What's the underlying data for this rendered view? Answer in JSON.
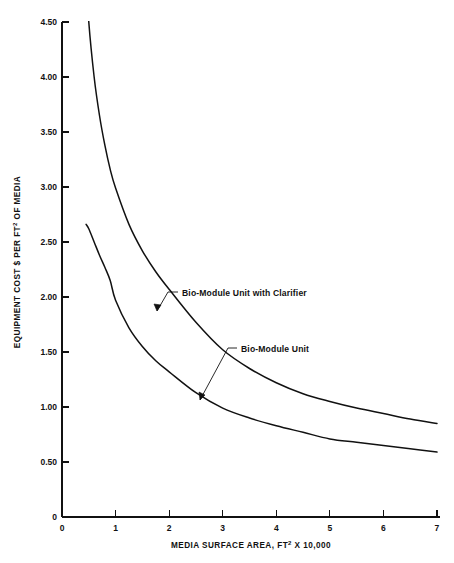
{
  "chart_data": {
    "type": "line",
    "title": "",
    "xlabel": "MEDIA SURFACE AREA, FT² X 10,000",
    "ylabel": "EQUIPMENT COST $ PER FT² OF MEDIA",
    "xlabel_parts": {
      "pre": "MEDIA SURFACE AREA, FT",
      "sup": "2",
      "post": " X 10,000"
    },
    "ylabel_parts": {
      "pre": "EQUIPMENT COST $ PER FT",
      "sup": "2",
      "post": " OF MEDIA"
    },
    "xlim": [
      0,
      7
    ],
    "ylim": [
      0,
      4.5
    ],
    "grid": false,
    "legend_position": "inline-annotations",
    "x_ticks": [
      "0",
      "1",
      "2",
      "3",
      "4",
      "5",
      "6",
      "7"
    ],
    "x_tick_values": [
      0,
      1,
      2,
      3,
      4,
      5,
      6,
      7
    ],
    "y_ticks": [
      "0",
      "0.50",
      "1.00",
      "1.50",
      "2.00",
      "2.50",
      "3.00",
      "3.50",
      "4.00",
      "4.50"
    ],
    "y_tick_values": [
      0,
      0.5,
      1.0,
      1.5,
      2.0,
      2.5,
      3.0,
      3.5,
      4.0,
      4.5
    ],
    "series": [
      {
        "name": "Bio-Module Unit with Clarifier",
        "x": [
          0.45,
          0.5,
          0.6,
          0.7,
          0.8,
          0.9,
          1.0,
          1.25,
          1.5,
          1.75,
          2.0,
          2.5,
          3.0,
          3.5,
          4.0,
          4.5,
          5.0,
          5.5,
          6.0,
          6.5,
          7.0
        ],
        "y": [
          4.95,
          4.5,
          4.0,
          3.65,
          3.38,
          3.16,
          2.99,
          2.66,
          2.42,
          2.23,
          2.07,
          1.77,
          1.52,
          1.35,
          1.22,
          1.12,
          1.05,
          0.99,
          0.94,
          0.89,
          0.85
        ]
      },
      {
        "name": "Bio-Module Unit",
        "x": [
          0.45,
          0.5,
          0.6,
          0.7,
          0.8,
          0.9,
          1.0,
          1.25,
          1.5,
          1.75,
          2.0,
          2.5,
          3.0,
          3.5,
          4.0,
          4.5,
          5.0,
          5.5,
          6.0,
          6.5,
          7.0
        ],
        "y": [
          2.66,
          2.62,
          2.5,
          2.38,
          2.27,
          2.15,
          1.97,
          1.72,
          1.55,
          1.42,
          1.32,
          1.13,
          0.99,
          0.9,
          0.83,
          0.77,
          0.71,
          0.68,
          0.65,
          0.62,
          0.59
        ]
      }
    ],
    "annotations": [
      {
        "label": "Bio-Module Unit with Clarifier",
        "text_x": 182,
        "text_y": 296,
        "leader": "M 178 292 L 168 292 L 157 311",
        "arrow": "M 157 311 L 154 304 L 161 305 Z"
      },
      {
        "label": "Bio-Module Unit",
        "text_x": 241,
        "text_y": 352,
        "leader": "M 237 348 L 228 348 L 200 400",
        "arrow": "M 200 400 L 199 392 L 205 395 Z"
      }
    ]
  },
  "geometry": {
    "origin_x": 62,
    "origin_y": 517,
    "x_px_per_unit": 53.57,
    "y_px_per_unit": 110.0,
    "axis_top_y": 22,
    "axis_right_x": 440
  }
}
